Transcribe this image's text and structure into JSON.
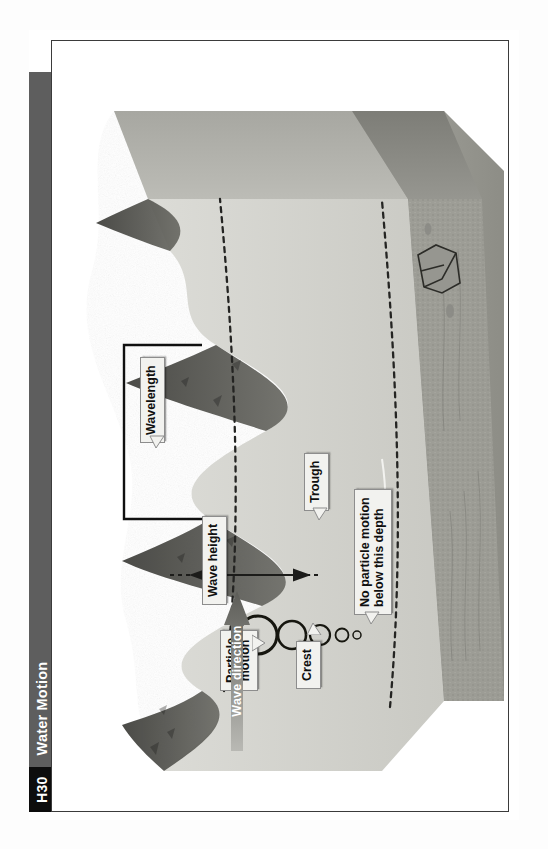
{
  "page": {
    "running_head": {
      "number": "H30",
      "title": "Water Motion",
      "number_bg": "#0d0d0d",
      "title_bg": "#5e5e5e",
      "text_color": "#ffffff"
    },
    "border_color": "#3b3b3b",
    "background": "#ffffff"
  },
  "figure": {
    "name": "wave-motion-diagram",
    "labels": [
      {
        "id": "crest",
        "text": "Crest"
      },
      {
        "id": "wave-height",
        "text": "Wave height"
      },
      {
        "id": "trough",
        "text": "Trough"
      },
      {
        "id": "wavelength",
        "text": "Wavelength"
      },
      {
        "id": "particle-motion",
        "text": "Particle\nmotion"
      },
      {
        "id": "no-particle-motion",
        "text": "No particle motion\nbelow this depth"
      }
    ],
    "wave_direction": {
      "text": "Wave direction",
      "arrow_color_start": "#6b6b6b",
      "arrow_color_end": "#bdbdbd",
      "text_color": "#ffffff"
    },
    "colors": {
      "water_surface_light": "#cfcfca",
      "water_surface_mid": "#b8b8b2",
      "water_body": "#d9d9d4",
      "wave_dark": "#4a4a46",
      "seafloor": "#9a9a93",
      "dashed_line": "#2b2b2b",
      "label_fill": "#f2f2ef",
      "label_border": "#8d8d8d"
    },
    "particle_orbits": {
      "description": "Circles shrinking with depth showing orbital motion of water particles",
      "count": 5,
      "radii": [
        19,
        14,
        10,
        6.5,
        4
      ]
    }
  }
}
